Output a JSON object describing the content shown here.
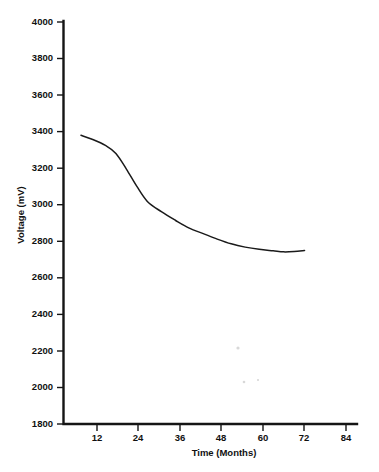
{
  "chart_data": {
    "type": "line",
    "title": "",
    "subtitle": "",
    "xlabel": "Time (Months)",
    "ylabel": "Voltage (mV)",
    "xlim": [
      0,
      84
    ],
    "ylim": [
      1800,
      4000
    ],
    "xticks": [
      12,
      24,
      36,
      48,
      60,
      72,
      84
    ],
    "xtick_labels": [
      "12",
      "24",
      "36",
      "48",
      "60",
      "72",
      "84"
    ],
    "yticks": [
      1800,
      2000,
      2200,
      2400,
      2600,
      2800,
      3000,
      3200,
      3400,
      3600,
      3800,
      4000
    ],
    "ytick_labels": [
      "1800",
      "2000",
      "2200",
      "2400",
      "2600",
      "2800",
      "3000",
      "3200",
      "3400",
      "3600",
      "3800",
      "4000"
    ],
    "grid": false,
    "legend": false,
    "legend_position": "none",
    "series": [
      {
        "name": "Voltage",
        "color": "#1a1a1a",
        "x": [
          5,
          8,
          12,
          15,
          18,
          21,
          24,
          28,
          32,
          36,
          40,
          44,
          48,
          52,
          56,
          60,
          63,
          66,
          69
        ],
        "values": [
          3380,
          3360,
          3325,
          3280,
          3195,
          3100,
          3018,
          2962,
          2915,
          2872,
          2842,
          2812,
          2786,
          2768,
          2756,
          2748,
          2742,
          2744,
          2750
        ]
      }
    ],
    "annotations": []
  },
  "axes": {
    "x_axis_name": "time-axis",
    "y_axis_name": "voltage-axis"
  }
}
